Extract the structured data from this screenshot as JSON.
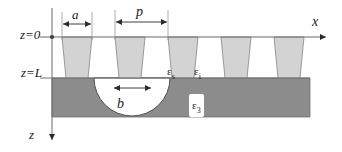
{
  "figure": {
    "colors": {
      "substrate_fill": "#8c8c8c",
      "ridge_fill": "#d3d3d3",
      "background": "#ffffff",
      "line": "#4d4d4d",
      "text": "#1a1a1a"
    }
  },
  "axes": {
    "x_label": "x",
    "z_label": "z",
    "z_top_label": "z=0",
    "z_interface_label": "z=L"
  },
  "dimensions": {
    "ridge_width_label": "a",
    "period_label": "p",
    "cavity_width_label": "b"
  },
  "regions": {
    "ridge_permittivity": {
      "base": "ε",
      "sub": "s"
    },
    "gap_permittivity": {
      "base": "ε",
      "sub": "i"
    },
    "substrate_permittivity": {
      "base": "ε",
      "sub": "3"
    }
  },
  "geometry": {
    "ridge_count": 5,
    "period_px": 53,
    "top_width_px": 30,
    "bottom_width_px": 22,
    "z0_y_px": 37,
    "zL_y_px": 78,
    "substrate_bottom_px": 117,
    "substrate_left_px": 52,
    "substrate_right_px": 310,
    "cavity_center_x_px": 132,
    "cavity_radius_x_px": 38,
    "cavity_depth_px": 38
  }
}
